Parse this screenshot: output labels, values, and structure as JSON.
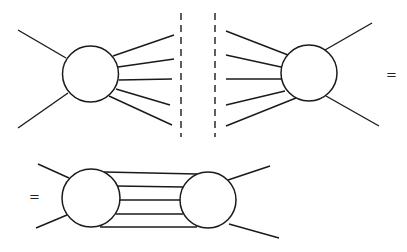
{
  "diagram": {
    "stroke_color": "#1a1a1a",
    "equals_signs": [
      {
        "label": "=",
        "x": 386,
        "y": 68
      },
      {
        "label": "=",
        "x": 29,
        "y": 190
      }
    ],
    "top_left_blob": {
      "circle": {
        "cx": 90.5,
        "cy": 74,
        "r": 28
      },
      "external_legs": [
        {
          "x1": 18,
          "y1": 30,
          "x2": 66,
          "y2": 58
        },
        {
          "x1": 18,
          "y1": 128,
          "x2": 68,
          "y2": 93
        }
      ],
      "cut_legs": [
        {
          "x1": 113,
          "y1": 56,
          "x2": 174,
          "y2": 35
        },
        {
          "x1": 118,
          "y1": 67,
          "x2": 174,
          "y2": 59
        },
        {
          "x1": 119,
          "y1": 80,
          "x2": 172,
          "y2": 79
        },
        {
          "x1": 116,
          "y1": 89,
          "x2": 170,
          "y2": 105
        },
        {
          "x1": 109,
          "y1": 96,
          "x2": 172,
          "y2": 125
        }
      ]
    },
    "cut_lines": [
      {
        "x": 181,
        "y1": 13,
        "y2": 137
      },
      {
        "x": 215,
        "y1": 13,
        "y2": 137
      }
    ],
    "top_right_blob": {
      "circle": {
        "cx": 309,
        "cy": 73,
        "r": 28
      },
      "cut_legs": [
        {
          "x1": 226,
          "y1": 31,
          "x2": 288,
          "y2": 55
        },
        {
          "x1": 226,
          "y1": 55,
          "x2": 281,
          "y2": 67
        },
        {
          "x1": 226,
          "y1": 79,
          "x2": 281,
          "y2": 79
        },
        {
          "x1": 226,
          "y1": 105,
          "x2": 285,
          "y2": 91
        },
        {
          "x1": 226,
          "y1": 126,
          "x2": 296,
          "y2": 98
        }
      ],
      "external_legs": [
        {
          "x1": 325,
          "y1": 50,
          "x2": 372,
          "y2": 23
        },
        {
          "x1": 326,
          "y1": 96,
          "x2": 379,
          "y2": 126
        }
      ]
    },
    "bottom_diagram": {
      "left_circle": {
        "cx": 91,
        "cy": 198,
        "r": 29
      },
      "right_circle": {
        "cx": 208,
        "cy": 200,
        "r": 28
      },
      "left_external_legs": [
        {
          "x1": 38,
          "y1": 164,
          "x2": 69,
          "y2": 178
        },
        {
          "x1": 36,
          "y1": 228,
          "x2": 67,
          "y2": 215
        }
      ],
      "right_external_legs": [
        {
          "x1": 228,
          "y1": 180,
          "x2": 270,
          "y2": 166
        },
        {
          "x1": 229,
          "y1": 224,
          "x2": 279,
          "y2": 238
        }
      ],
      "internal_lines": [
        {
          "x1": 104,
          "y1": 172,
          "x2": 197,
          "y2": 174
        },
        {
          "x1": 116,
          "y1": 186,
          "x2": 183,
          "y2": 187
        },
        {
          "x1": 120,
          "y1": 200,
          "x2": 180,
          "y2": 200
        },
        {
          "x1": 116,
          "y1": 214,
          "x2": 183,
          "y2": 214
        },
        {
          "x1": 100,
          "y1": 227,
          "x2": 197,
          "y2": 227
        }
      ]
    }
  }
}
